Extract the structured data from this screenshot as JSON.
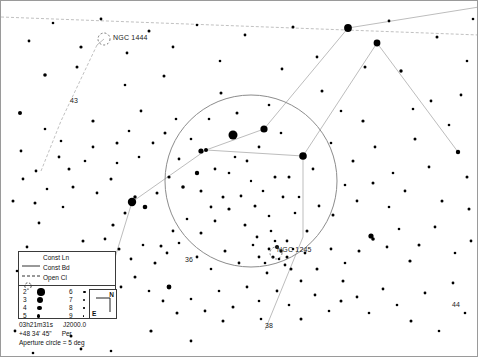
{
  "chart_data": {
    "type": "scatter",
    "xlabel": "Right Ascension",
    "ylabel": "Declination",
    "projection": "equatorial",
    "field_width_deg": 12,
    "grid": false,
    "legend_position": "bottom-left",
    "center": {
      "ra": "03h21m31s",
      "dec": "+48 34' 45\"",
      "epoch": "J2000.0",
      "constellation": "Per"
    },
    "aperture_circle": {
      "label": "Aperture circle = 5 deg",
      "diameter_deg": 5,
      "cx": 250,
      "cy": 180,
      "r": 86
    },
    "magnitude_limits": [
      2,
      9
    ],
    "deep_sky_objects": [
      {
        "name": "NGC 1444",
        "type": "Open Cl",
        "x": 103,
        "y": 38,
        "label_x": 112,
        "label_y": 33
      },
      {
        "name": "NGC 1245",
        "type": "Open Cl",
        "x": 275,
        "y": 252,
        "label_x": 276,
        "label_y": 245
      }
    ],
    "star_labels": [
      {
        "name": "43",
        "x": 72,
        "y": 104,
        "label_x": 69,
        "label_y": 96
      },
      {
        "name": "36",
        "x": 183,
        "y": 264,
        "label_x": 184,
        "label_y": 255
      },
      {
        "name": "38",
        "x": 264,
        "y": 329,
        "label_x": 264,
        "label_y": 321
      },
      {
        "name": "44",
        "x": 452,
        "y": 308,
        "label_x": 451,
        "label_y": 300
      }
    ],
    "stars": [
      [
        250,
        180,
        1.2
      ],
      [
        232,
        134,
        4.5
      ],
      [
        263,
        128,
        3.6
      ],
      [
        302,
        155,
        3.8
      ],
      [
        347,
        27,
        3.9
      ],
      [
        131,
        201,
        4.2
      ],
      [
        200,
        150,
        2.6
      ],
      [
        205,
        149,
        2.0
      ],
      [
        98,
        309,
        3.2
      ],
      [
        168,
        286,
        2.4
      ],
      [
        376,
        42,
        3.4
      ],
      [
        457,
        151,
        2.2
      ],
      [
        19,
        112,
        2.0
      ],
      [
        44,
        74,
        1.8
      ],
      [
        80,
        46,
        1.6
      ],
      [
        126,
        52,
        1.4
      ],
      [
        163,
        75,
        1.5
      ],
      [
        219,
        60,
        1.3
      ],
      [
        281,
        68,
        1.4
      ],
      [
        321,
        90,
        1.5
      ],
      [
        362,
        120,
        1.6
      ],
      [
        400,
        70,
        1.7
      ],
      [
        430,
        100,
        1.4
      ],
      [
        466,
        60,
        1.3
      ],
      [
        441,
        200,
        1.5
      ],
      [
        470,
        240,
        1.4
      ],
      [
        409,
        260,
        1.6
      ],
      [
        370,
        235,
        2.6
      ],
      [
        372,
        238,
        1.8
      ],
      [
        340,
        300,
        1.5
      ],
      [
        300,
        280,
        1.4
      ],
      [
        258,
        300,
        1.3
      ],
      [
        222,
        320,
        1.5
      ],
      [
        190,
        340,
        1.4
      ],
      [
        150,
        330,
        1.6
      ],
      [
        110,
        350,
        1.3
      ],
      [
        70,
        335,
        1.5
      ],
      [
        40,
        300,
        1.4
      ],
      [
        16,
        270,
        1.3
      ],
      [
        12,
        200,
        1.5
      ],
      [
        35,
        170,
        1.4
      ],
      [
        60,
        140,
        1.3
      ],
      [
        92,
        120,
        1.6
      ],
      [
        140,
        110,
        1.4
      ],
      [
        175,
        118,
        1.3
      ],
      [
        200,
        190,
        1.5
      ],
      [
        214,
        168,
        1.4
      ],
      [
        228,
        172,
        1.3
      ],
      [
        240,
        195,
        1.4
      ],
      [
        254,
        205,
        1.5
      ],
      [
        268,
        215,
        1.3
      ],
      [
        282,
        196,
        1.4
      ],
      [
        294,
        212,
        1.3
      ],
      [
        306,
        230,
        1.5
      ],
      [
        318,
        205,
        1.4
      ],
      [
        228,
        208,
        1.6
      ],
      [
        214,
        220,
        1.4
      ],
      [
        200,
        232,
        1.5
      ],
      [
        186,
        218,
        1.3
      ],
      [
        172,
        230,
        1.4
      ],
      [
        160,
        245,
        1.5
      ],
      [
        196,
        256,
        1.4
      ],
      [
        210,
        268,
        1.3
      ],
      [
        224,
        250,
        1.5
      ],
      [
        238,
        262,
        1.4
      ],
      [
        252,
        244,
        1.3
      ],
      [
        266,
        272,
        1.4
      ],
      [
        278,
        258,
        1.3
      ],
      [
        290,
        268,
        1.5
      ],
      [
        304,
        252,
        1.4
      ],
      [
        196,
        172,
        2.2
      ],
      [
        182,
        186,
        1.8
      ],
      [
        168,
        176,
        1.6
      ],
      [
        156,
        192,
        1.5
      ],
      [
        144,
        206,
        2.3
      ],
      [
        134,
        196,
        1.7
      ],
      [
        124,
        212,
        1.5
      ],
      [
        112,
        224,
        1.6
      ],
      [
        104,
        238,
        1.4
      ],
      [
        118,
        248,
        1.5
      ],
      [
        130,
        258,
        1.4
      ],
      [
        142,
        244,
        1.3
      ],
      [
        154,
        262,
        1.5
      ],
      [
        166,
        252,
        1.4
      ],
      [
        178,
        242,
        1.3
      ],
      [
        96,
        262,
        2.4
      ],
      [
        100,
        268,
        1.9
      ],
      [
        108,
        276,
        1.6
      ],
      [
        86,
        282,
        1.5
      ],
      [
        120,
        286,
        1.4
      ],
      [
        134,
        276,
        1.5
      ],
      [
        148,
        290,
        1.3
      ],
      [
        162,
        300,
        1.4
      ],
      [
        176,
        312,
        1.5
      ],
      [
        190,
        298,
        1.3
      ],
      [
        204,
        310,
        1.4
      ],
      [
        218,
        290,
        1.3
      ],
      [
        232,
        306,
        1.5
      ],
      [
        246,
        286,
        1.4
      ],
      [
        260,
        318,
        1.3
      ],
      [
        276,
        290,
        1.4
      ],
      [
        288,
        304,
        1.3
      ],
      [
        300,
        318,
        1.5
      ],
      [
        314,
        294,
        1.4
      ],
      [
        328,
        310,
        1.3
      ],
      [
        342,
        280,
        1.5
      ],
      [
        356,
        296,
        1.4
      ],
      [
        368,
        312,
        1.3
      ],
      [
        382,
        288,
        1.4
      ],
      [
        396,
        304,
        1.3
      ],
      [
        410,
        320,
        1.5
      ],
      [
        424,
        292,
        1.4
      ],
      [
        438,
        330,
        1.3
      ],
      [
        452,
        282,
        1.4
      ],
      [
        464,
        312,
        1.3
      ],
      [
        28,
        40,
        1.4
      ],
      [
        52,
        22,
        1.3
      ],
      [
        76,
        66,
        1.5
      ],
      [
        100,
        18,
        1.4
      ],
      [
        124,
        84,
        1.3
      ],
      [
        148,
        30,
        1.5
      ],
      [
        172,
        46,
        1.4
      ],
      [
        196,
        24,
        1.3
      ],
      [
        220,
        92,
        1.5
      ],
      [
        244,
        34,
        1.4
      ],
      [
        268,
        104,
        1.3
      ],
      [
        292,
        26,
        1.5
      ],
      [
        316,
        56,
        1.4
      ],
      [
        340,
        110,
        1.3
      ],
      [
        364,
        66,
        1.5
      ],
      [
        388,
        20,
        1.4
      ],
      [
        412,
        108,
        1.3
      ],
      [
        436,
        36,
        1.5
      ],
      [
        460,
        94,
        1.4
      ],
      [
        472,
        18,
        1.3
      ],
      [
        20,
        150,
        1.4
      ],
      [
        44,
        128,
        1.3
      ],
      [
        68,
        168,
        1.5
      ],
      [
        92,
        146,
        1.4
      ],
      [
        116,
        162,
        1.3
      ],
      [
        38,
        222,
        1.4
      ],
      [
        62,
        206,
        1.3
      ],
      [
        82,
        240,
        1.5
      ],
      [
        26,
        246,
        1.4
      ],
      [
        50,
        266,
        1.3
      ],
      [
        14,
        330,
        1.4
      ],
      [
        32,
        352,
        1.3
      ],
      [
        56,
        312,
        1.5
      ],
      [
        80,
        348,
        1.4
      ],
      [
        208,
        118,
        1.3
      ],
      [
        236,
        112,
        1.5
      ],
      [
        258,
        146,
        1.4
      ],
      [
        280,
        132,
        1.3
      ],
      [
        288,
        176,
        1.5
      ],
      [
        312,
        168,
        1.4
      ],
      [
        330,
        142,
        1.3
      ],
      [
        352,
        160,
        1.5
      ],
      [
        374,
        146,
        1.4
      ],
      [
        392,
        172,
        1.3
      ],
      [
        414,
        138,
        1.5
      ],
      [
        428,
        166,
        1.4
      ],
      [
        448,
        124,
        1.3
      ],
      [
        466,
        176,
        1.5
      ],
      [
        246,
        160,
        1.4
      ],
      [
        234,
        156,
        1.3
      ],
      [
        222,
        196,
        1.5
      ],
      [
        210,
        206,
        1.4
      ],
      [
        262,
        190,
        1.3
      ],
      [
        274,
        176,
        1.5
      ],
      [
        286,
        240,
        1.4
      ],
      [
        298,
        196,
        1.3
      ],
      [
        244,
        224,
        1.5
      ],
      [
        256,
        236,
        1.4
      ],
      [
        270,
        230,
        1.3
      ],
      [
        316,
        268,
        1.5
      ],
      [
        330,
        248,
        1.4
      ],
      [
        344,
        262,
        1.3
      ],
      [
        358,
        250,
        1.5
      ],
      [
        386,
        246,
        1.4
      ],
      [
        398,
        228,
        1.3
      ],
      [
        418,
        244,
        1.5
      ],
      [
        434,
        226,
        1.4
      ],
      [
        454,
        252,
        1.3
      ],
      [
        468,
        208,
        1.5
      ],
      [
        404,
        190,
        1.4
      ],
      [
        388,
        206,
        1.3
      ],
      [
        372,
        182,
        1.5
      ],
      [
        356,
        200,
        1.4
      ],
      [
        344,
        184,
        1.3
      ],
      [
        332,
        214,
        1.5
      ],
      [
        152,
        142,
        1.4
      ],
      [
        138,
        156,
        1.3
      ],
      [
        164,
        132,
        1.5
      ],
      [
        178,
        158,
        1.4
      ],
      [
        190,
        138,
        1.3
      ],
      [
        110,
        178,
        1.5
      ],
      [
        96,
        192,
        1.4
      ],
      [
        84,
        160,
        1.3
      ],
      [
        72,
        186,
        1.5
      ],
      [
        58,
        156,
        1.4
      ],
      [
        46,
        188,
        1.3
      ],
      [
        34,
        202,
        1.5
      ],
      [
        22,
        178,
        1.4
      ],
      [
        128,
        130,
        1.3
      ],
      [
        116,
        142,
        1.5
      ],
      [
        276,
        246,
        2.0
      ],
      [
        280,
        250,
        1.7
      ],
      [
        272,
        256,
        1.6
      ],
      [
        286,
        256,
        1.5
      ],
      [
        268,
        248,
        1.4
      ],
      [
        258,
        256,
        1.4
      ],
      [
        292,
        248,
        1.3
      ],
      [
        264,
        262,
        1.3
      ],
      [
        284,
        264,
        1.4
      ],
      [
        274,
        240,
        1.3
      ]
    ],
    "constellation_lines": [
      {
        "name": "line-to-ngc1444",
        "points": [
          [
            96,
            44
          ],
          [
            103,
            38
          ]
        ]
      },
      {
        "name": "perseus-chain-1",
        "points": [
          [
            205,
            149
          ],
          [
            263,
            128
          ],
          [
            347,
            27
          ]
        ]
      },
      {
        "name": "perseus-chain-2",
        "points": [
          [
            205,
            149
          ],
          [
            302,
            155
          ],
          [
            302,
            236
          ],
          [
            264,
            329
          ]
        ]
      },
      {
        "name": "perseus-chain-3",
        "points": [
          [
            205,
            149
          ],
          [
            131,
            201
          ],
          [
            98,
            309
          ]
        ]
      },
      {
        "name": "perseus-chain-4",
        "points": [
          [
            302,
            155
          ],
          [
            376,
            42
          ]
        ]
      },
      {
        "name": "perseus-chain-5",
        "points": [
          [
            347,
            27
          ],
          [
            478,
            6
          ]
        ]
      },
      {
        "name": "perseus-chain-6",
        "points": [
          [
            376,
            42
          ],
          [
            457,
            151
          ]
        ]
      }
    ],
    "constellation_boundaries": [
      {
        "name": "boundary-upper",
        "points": [
          [
            0,
            16
          ],
          [
            478,
            34
          ]
        ]
      },
      {
        "name": "boundary-left",
        "points": [
          [
            96,
            44
          ],
          [
            60,
            120
          ],
          [
            40,
            170
          ]
        ]
      }
    ]
  },
  "legend": {
    "entries": [
      {
        "key": "const-line",
        "label": "Const Ln",
        "swatch": "solid-line"
      },
      {
        "key": "const-boundary",
        "label": "Const Bd",
        "swatch": "dashed-line"
      },
      {
        "key": "open-cluster",
        "label": "Open Cl",
        "swatch": "dashed-circle"
      }
    ],
    "magnitudes": [
      {
        "mag": "2",
        "size": 7.5,
        "col": 0,
        "row": 0
      },
      {
        "mag": "3",
        "size": 6.0,
        "col": 0,
        "row": 1
      },
      {
        "mag": "4",
        "size": 4.6,
        "col": 0,
        "row": 2
      },
      {
        "mag": "5",
        "size": 3.4,
        "col": 0,
        "row": 3
      },
      {
        "mag": "6",
        "size": 2.6,
        "col": 1,
        "row": 0
      },
      {
        "mag": "7",
        "size": 2.0,
        "col": 1,
        "row": 1
      },
      {
        "mag": "8",
        "size": 1.6,
        "col": 1,
        "row": 2
      },
      {
        "mag": "9",
        "size": 1.2,
        "col": 1,
        "row": 3
      }
    ]
  },
  "compass": {
    "north_label": "N",
    "east_label": "E"
  },
  "coordinates": {
    "ra": "03h21m31s",
    "epoch": "J2000.0",
    "dec": "+48 34' 45\"",
    "constellation": "Per",
    "aperture_note": "Aperture circle = 5 deg"
  }
}
